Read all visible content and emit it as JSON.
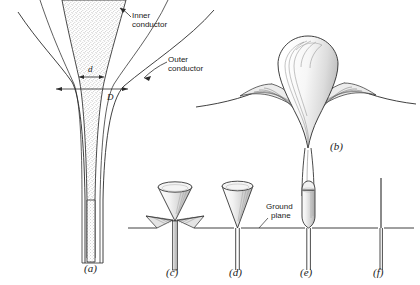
{
  "figure": {
    "background_color": "#ffffff",
    "ink_color": "#1a1a1a",
    "stipple_color": "#9a9a9a"
  },
  "annotations": {
    "inner_conductor": "Inner\nconductor",
    "inner_conductor_line1": "Inner",
    "inner_conductor_line2": "conductor",
    "outer_conductor_line1": "Outer",
    "outer_conductor_line2": "conductor",
    "ground_plane_line1": "Ground",
    "ground_plane_line2": "plane",
    "dimension_d": "d",
    "dimension_D": "D"
  },
  "captions": {
    "a": "(a)",
    "b": "(b)",
    "c": "(c)",
    "d": "(d)",
    "e": "(e)",
    "f": "(f)"
  },
  "panels": [
    {
      "id": "a",
      "caption": "(a)",
      "description": "Exponentially tapered coaxial line transition with stippled inner conductor and flared outer conductor",
      "labels": [
        "Inner conductor",
        "Outer conductor",
        "d",
        "D"
      ]
    },
    {
      "id": "b",
      "caption": "(b)",
      "description": "Bulb shaped teardrop radiator over curved flared ground surface, shaded with hatch lines"
    },
    {
      "id": "c",
      "caption": "(c)",
      "description": "Discone antenna: cone with sloping skirt wings above ground plane"
    },
    {
      "id": "d",
      "caption": "(d)",
      "description": "Conical monopole over flat ground plane",
      "labels": [
        "Ground plane"
      ]
    },
    {
      "id": "e",
      "caption": "(e)",
      "description": "Thick cylindrical monopole with rounded top over ground plane"
    },
    {
      "id": "f",
      "caption": "(f)",
      "description": "Thin wire monopole over ground plane"
    }
  ]
}
